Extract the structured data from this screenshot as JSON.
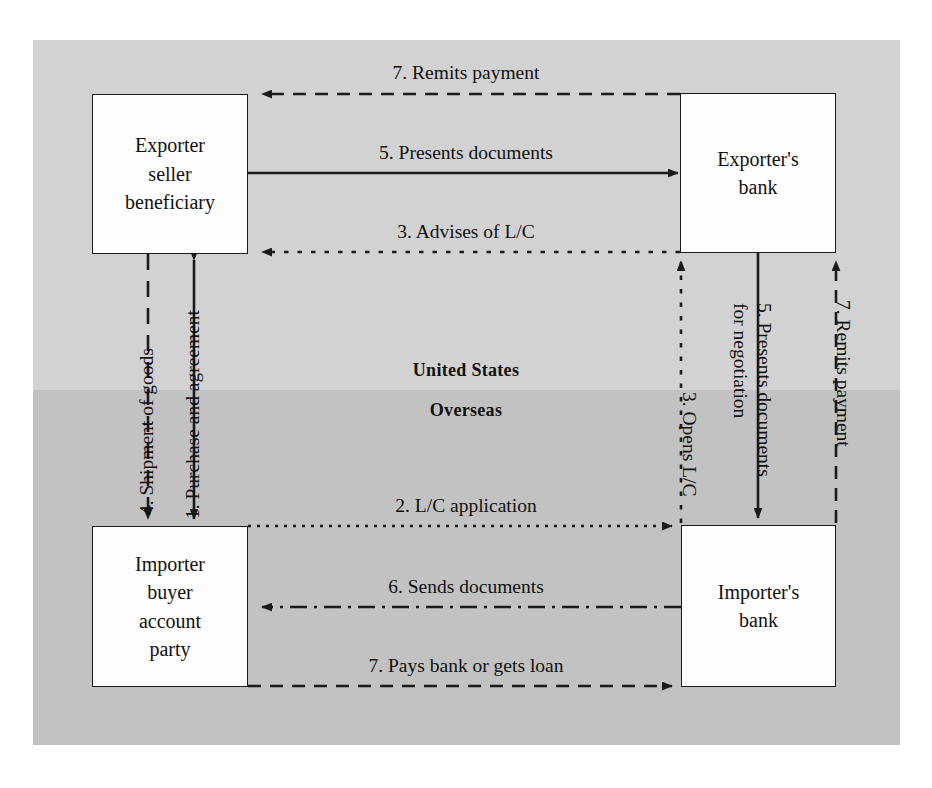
{
  "diagram": {
    "zones": [
      {
        "id": "united-states",
        "label": "United States",
        "fill": "#d2d2d2"
      },
      {
        "id": "overseas",
        "label": "Overseas",
        "fill": "#c2c2c2"
      }
    ],
    "boxes": [
      {
        "id": "exporter",
        "lines": [
          "Exporter",
          "seller",
          "beneficiary"
        ]
      },
      {
        "id": "exporter-bank",
        "lines": [
          "Exporter's",
          "bank"
        ]
      },
      {
        "id": "importer",
        "lines": [
          "Importer",
          "buyer",
          "account",
          "party"
        ]
      },
      {
        "id": "importer-bank",
        "lines": [
          "Importer's",
          "bank"
        ]
      }
    ],
    "flows": [
      {
        "step": 7,
        "label": "7. Remits payment",
        "from": "exporter-bank",
        "to": "exporter",
        "orientation": "horizontal",
        "direction": "left",
        "line_style": "dashed"
      },
      {
        "step": 5,
        "label": "5. Presents documents",
        "from": "exporter",
        "to": "exporter-bank",
        "orientation": "horizontal",
        "direction": "right",
        "line_style": "solid"
      },
      {
        "step": 3,
        "label": "3. Advises of L/C",
        "from": "exporter-bank",
        "to": "exporter",
        "orientation": "horizontal",
        "direction": "left",
        "line_style": "dotted"
      },
      {
        "step": 4,
        "label": "4. Shipment of goods",
        "from": "exporter",
        "to": "importer",
        "orientation": "vertical",
        "direction": "down",
        "line_style": "dashed"
      },
      {
        "step": 1,
        "label": "1. Purchase and agreement",
        "from": "importer",
        "to": "exporter",
        "orientation": "vertical",
        "direction": "both",
        "line_style": "solid"
      },
      {
        "step": 3,
        "label": "3. Opens L/C",
        "from": "importer-bank",
        "to": "exporter-bank",
        "orientation": "vertical",
        "direction": "up",
        "line_style": "dotted"
      },
      {
        "step": 5,
        "label": "5. Presents documents for negotiation",
        "from": "exporter-bank",
        "to": "importer-bank",
        "orientation": "vertical",
        "direction": "down",
        "line_style": "solid"
      },
      {
        "step": 7,
        "label": "7. Remits payment",
        "from": "importer-bank",
        "to": "exporter-bank",
        "orientation": "vertical",
        "direction": "up",
        "line_style": "dashed"
      },
      {
        "step": 2,
        "label": "2. L/C application",
        "from": "importer",
        "to": "importer-bank",
        "orientation": "horizontal",
        "direction": "right",
        "line_style": "dotted"
      },
      {
        "step": 6,
        "label": "6. Sends documents",
        "from": "importer-bank",
        "to": "importer",
        "orientation": "horizontal",
        "direction": "left",
        "line_style": "dash-dot"
      },
      {
        "step": 7,
        "label": "7. Pays bank or gets loan",
        "from": "importer",
        "to": "importer-bank",
        "orientation": "horizontal",
        "direction": "right",
        "line_style": "dashed"
      }
    ],
    "vertical_label_parts": {
      "presents_documents_l1": "5. Presents documents",
      "presents_documents_l2": "for negotiation"
    },
    "colors": {
      "line": "#1b1b1b",
      "box_fill": "#fdfdfd",
      "page": "#ffffff"
    }
  }
}
